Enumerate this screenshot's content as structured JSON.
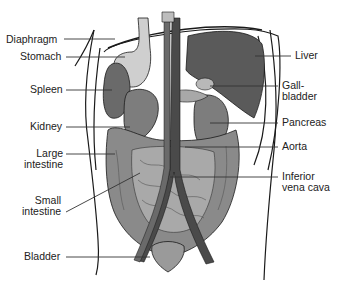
{
  "diagram": {
    "colors": {
      "organ_dark": "#5a5a5a",
      "organ_mid": "#7d7d7d",
      "organ_light": "#b8b8b8",
      "stomach": "#cfcfcf",
      "vessel": "#4a4a4a",
      "outline": "#1a1a1a",
      "leader": "#333333"
    },
    "labels_left": [
      {
        "id": "diaphragm",
        "text": "Diaphragm",
        "x": 6,
        "y": 34,
        "tx": 115,
        "ty": 39
      },
      {
        "id": "stomach",
        "text": "Stomach",
        "x": 20,
        "y": 51,
        "tx": 125,
        "ty": 57
      },
      {
        "id": "spleen",
        "text": "Spleen",
        "x": 30,
        "y": 84,
        "tx": 112,
        "ty": 90
      },
      {
        "id": "kidney",
        "text": "Kidney",
        "x": 30,
        "y": 121,
        "tx": 130,
        "ty": 127
      },
      {
        "id": "large-intestine",
        "text": "Large\nintestine",
        "x": 24,
        "y": 148,
        "tx": 115,
        "ty": 154
      },
      {
        "id": "small-intestine",
        "text": "Small\nintestine",
        "x": 22,
        "y": 195,
        "tx": 140,
        "ty": 173
      },
      {
        "id": "bladder",
        "text": "Bladder",
        "x": 24,
        "y": 251,
        "tx": 150,
        "ty": 257
      }
    ],
    "labels_right": [
      {
        "id": "liver",
        "text": "Liver",
        "x": 295,
        "y": 50,
        "tx": 255,
        "ty": 56
      },
      {
        "id": "gall-bladder",
        "text": "Gall-\nbladder",
        "x": 282,
        "y": 80,
        "tx": 210,
        "ty": 86
      },
      {
        "id": "pancreas",
        "text": "Pancreas",
        "x": 282,
        "y": 117,
        "tx": 210,
        "ty": 123
      },
      {
        "id": "aorta",
        "text": "Aorta",
        "x": 282,
        "y": 141,
        "tx": 185,
        "ty": 147
      },
      {
        "id": "inferior-vena-cava",
        "text": "Inferior\nvena cava",
        "x": 282,
        "y": 171,
        "tx": 170,
        "ty": 177
      }
    ]
  }
}
